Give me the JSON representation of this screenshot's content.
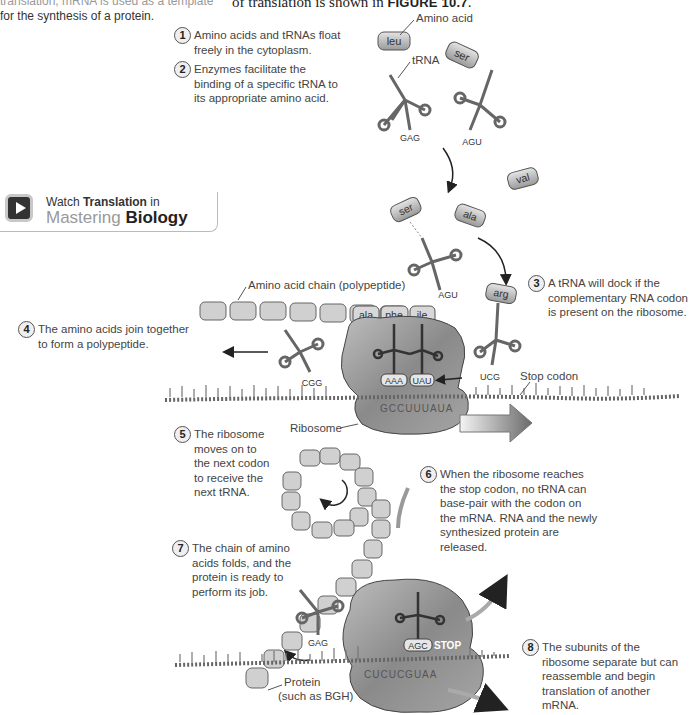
{
  "header": {
    "left_text_line1": "translation, mRNA is used as a template",
    "left_text_line2": "for the synthesis of a protein.",
    "right_text_prefix": "of translation is shown in ",
    "right_text_figure": "FIGURE 10.7",
    "right_text_suffix": "."
  },
  "watch_box": {
    "icon": "play-icon",
    "line1_prefix": "Watch ",
    "line1_bold": "Translation",
    "line1_suffix": " in",
    "brand_light": "Mastering ",
    "brand_bold": "Biology"
  },
  "steps": [
    {
      "num": "1",
      "text": "Amino acids and tRNAs float freely in the cytoplasm."
    },
    {
      "num": "2",
      "text": "Enzymes facilitate the binding of a specific tRNA to its appropriate amino acid."
    },
    {
      "num": "3",
      "text": "A tRNA will dock if the complementary RNA codon is present on the ribosome."
    },
    {
      "num": "4",
      "text": "The amino acids join together to form a polypeptide."
    },
    {
      "num": "5",
      "text": "The ribosome moves on to the next codon to receive the next tRNA."
    },
    {
      "num": "6",
      "text": "When the ribosome reaches the stop codon, no tRNA can base-pair with the codon on the mRNA. RNA and the newly synthesized protein are released."
    },
    {
      "num": "7",
      "text": "The chain of amino acids folds, and the protein is ready to perform its job."
    },
    {
      "num": "8",
      "text": "The subunits of the ribosome separate but can reassemble and begin translation of another mRNA."
    }
  ],
  "labels": {
    "amino_acid": "Amino acid",
    "trna": "tRNA",
    "chain": "Amino acid chain (polypeptide)",
    "stop_codon": "Stop codon",
    "ribosome": "Ribosome",
    "protein_line1": "Protein",
    "protein_line2": "(such as BGH)"
  },
  "amino_acids": {
    "free": [
      "leu",
      "ser",
      "val",
      "ser",
      "ala",
      "arg"
    ],
    "chain_labeled": [
      "ala",
      "phe",
      "ile"
    ]
  },
  "anticodons": {
    "free_trna_1": "GAG",
    "free_trna_2": "AGU",
    "bound_ser_trna": "AGU",
    "arg_trna": "UCG",
    "exiting_trna": "CGG",
    "site_p": "AAA",
    "site_a": "UAU",
    "final_exiting": "GAG",
    "final_site": "AGC"
  },
  "mrna": {
    "ribosome_codons": "GCCUUUAUA",
    "final_codons": "CUCUCGUAA",
    "stop_label": "STOP"
  },
  "colors": {
    "ink": "#333333",
    "protein_fill": "#c9c9c9",
    "ribosome_fill": "#8e8e8e",
    "arrow": "#222222"
  }
}
